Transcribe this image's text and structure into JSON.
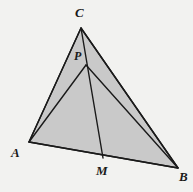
{
  "figure": {
    "kind": "triangle-with-cevians",
    "background_color": "#f2f2f0",
    "fill_color": "#c9c9c9",
    "stroke_color": "#1a1a1a",
    "stroke_width": 1.4,
    "canvas": {
      "width": 193,
      "height": 192
    },
    "points": {
      "C": {
        "x": 81,
        "y": 28,
        "label": "C"
      },
      "A": {
        "x": 29,
        "y": 142,
        "label": "A"
      },
      "B": {
        "x": 178,
        "y": 168,
        "label": "B"
      },
      "P": {
        "x": 86,
        "y": 65,
        "label": "P"
      },
      "M": {
        "x": 103,
        "y": 158,
        "label": "M"
      }
    },
    "polygons": [
      {
        "name": "triangle-ACB",
        "vertices": "C,A,B",
        "filled": true
      }
    ],
    "segments": [
      {
        "name": "segment-CA",
        "from": "C",
        "to": "A"
      },
      {
        "name": "segment-AB",
        "from": "A",
        "to": "B"
      },
      {
        "name": "segment-BC",
        "from": "B",
        "to": "C"
      },
      {
        "name": "segment-CM",
        "from": "C",
        "to": "M"
      },
      {
        "name": "segment-PA",
        "from": "P",
        "to": "A"
      },
      {
        "name": "segment-PB",
        "from": "P",
        "to": "B"
      }
    ],
    "labels": {
      "C": "C",
      "P": "P",
      "A": "A",
      "M": "M",
      "B": "B"
    }
  }
}
